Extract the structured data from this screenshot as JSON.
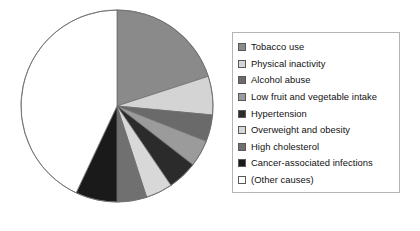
{
  "chart_data": {
    "type": "pie",
    "title": "",
    "subtitle": "",
    "xlabel": "",
    "ylabel": "",
    "grid": false,
    "legend_position": "right",
    "start_angle_deg": 0,
    "direction": "clockwise",
    "categories": [
      "Tobacco use",
      "Physical inactivity",
      "Alcohol abuse",
      "Low fruit and vegetable intake",
      "Hypertension",
      "Overweight and obesity",
      "High cholesterol",
      "Cancer-associated infections",
      "(Other causes)"
    ],
    "values": [
      20.0,
      6.5,
      4.5,
      4.5,
      5.0,
      4.5,
      5.0,
      7.0,
      43.0
    ],
    "colors": [
      "#8a8a8a",
      "#d4d4d4",
      "#6a6a6a",
      "#9b9b9b",
      "#2b2b2b",
      "#d8d8d8",
      "#707070",
      "#1a1a1a",
      "#ffffff"
    ],
    "slices": [
      {
        "label": "Tobacco use",
        "value": 20.0,
        "color": "#8a8a8a",
        "start_deg": 0.0,
        "end_deg": 72.0
      },
      {
        "label": "Physical inactivity",
        "value": 6.5,
        "color": "#d4d4d4",
        "start_deg": 72.0,
        "end_deg": 95.4
      },
      {
        "label": "Alcohol abuse",
        "value": 4.5,
        "color": "#6a6a6a",
        "start_deg": 95.4,
        "end_deg": 111.6
      },
      {
        "label": "Low fruit and vegetable intake",
        "value": 4.5,
        "color": "#9b9b9b",
        "start_deg": 111.6,
        "end_deg": 127.8
      },
      {
        "label": "Hypertension",
        "value": 5.0,
        "color": "#2b2b2b",
        "start_deg": 127.8,
        "end_deg": 145.8
      },
      {
        "label": "Overweight and obesity",
        "value": 4.5,
        "color": "#d8d8d8",
        "start_deg": 145.8,
        "end_deg": 162.0
      },
      {
        "label": "High cholesterol",
        "value": 5.0,
        "color": "#707070",
        "start_deg": 162.0,
        "end_deg": 180.0
      },
      {
        "label": "Cancer-associated infections",
        "value": 7.0,
        "color": "#1a1a1a",
        "start_deg": 180.0,
        "end_deg": 205.2
      },
      {
        "label": "(Other causes)",
        "value": 43.0,
        "color": "#ffffff",
        "start_deg": 205.2,
        "end_deg": 360.0
      }
    ],
    "geometry": {
      "center_x": 100,
      "center_y": 100,
      "radius": 96,
      "stroke": "#6e6e6e",
      "stroke_width": 0.8
    }
  },
  "legend": {
    "border_color": "#b4b4b4",
    "background": "#ffffff",
    "items": [
      {
        "label": "Tobacco use",
        "color": "#8a8a8a"
      },
      {
        "label": "Physical inactivity",
        "color": "#d4d4d4"
      },
      {
        "label": "Alcohol abuse",
        "color": "#6a6a6a"
      },
      {
        "label": "Low fruit and vegetable intake",
        "color": "#9b9b9b"
      },
      {
        "label": "Hypertension",
        "color": "#2b2b2b"
      },
      {
        "label": "Overweight and obesity",
        "color": "#d8d8d8"
      },
      {
        "label": "High cholesterol",
        "color": "#707070"
      },
      {
        "label": "Cancer-associated infections",
        "color": "#1a1a1a"
      },
      {
        "label": "(Other causes)",
        "color": "#ffffff"
      }
    ]
  }
}
